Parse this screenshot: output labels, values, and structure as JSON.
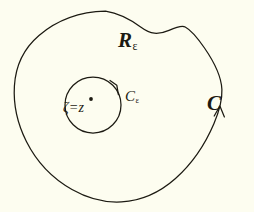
{
  "figure": {
    "type": "contour-integration-diagram",
    "background_color": "#fdfdf0",
    "ink_color": "#1c1a12",
    "width": 254,
    "height": 212
  },
  "labels": {
    "region": {
      "base": "R",
      "subscript": "ε",
      "full": "Rε"
    },
    "inner_contour": {
      "base": "C",
      "subscript": "ε",
      "full": "Cε"
    },
    "outer_contour": {
      "base": "C",
      "subscript": "",
      "full": "C"
    },
    "point": {
      "zeta": "ζ",
      "equals": "=",
      "z": "z",
      "full": "ζ = z"
    }
  },
  "geometry": {
    "outer_curve": {
      "name": "C",
      "closed": true,
      "orientation": "counterclockwise",
      "extremes": {
        "left_x": 14,
        "right_x": 222,
        "top_y": 11,
        "bottom_y": 202
      },
      "arrow_at": {
        "x": 220,
        "y": 107,
        "direction": "up"
      }
    },
    "inner_circle": {
      "name": "Cε",
      "center": {
        "x": 93,
        "y": 105
      },
      "radius": 28,
      "orientation": "counterclockwise",
      "arrow_at": {
        "x": 117,
        "y": 86,
        "direction": "up-left"
      }
    },
    "point_marker": {
      "x": 91,
      "y": 99,
      "radius": 1.9
    }
  }
}
